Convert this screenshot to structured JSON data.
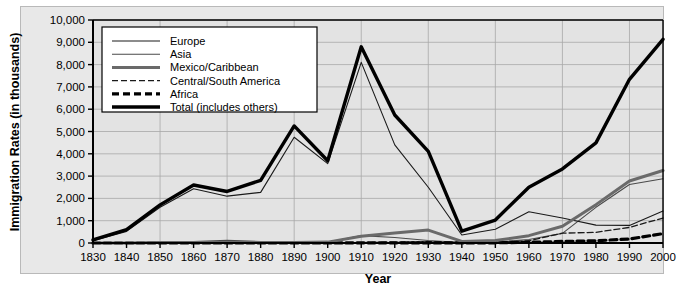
{
  "chart_data": {
    "type": "line",
    "title": "",
    "xlabel": "Year",
    "ylabel": "Immigration Rates (in thousands)",
    "xlim": [
      1830,
      2000
    ],
    "ylim": [
      0,
      10000
    ],
    "grid": true,
    "legend_position": "top-left",
    "x_tick_labels": [
      "1830",
      "1840",
      "1850",
      "1860",
      "1870",
      "1880",
      "1890",
      "1900",
      "1910",
      "1920",
      "1930",
      "1940",
      "1950",
      "1960",
      "1970",
      "1980",
      "1990",
      "2000"
    ],
    "y_tick_labels": [
      "0",
      "1,000",
      "2,000",
      "3,000",
      "4,000",
      "5,000",
      "6,000",
      "7,000",
      "8,000",
      "9,000",
      "10,000"
    ],
    "x": [
      1830,
      1840,
      1850,
      1860,
      1870,
      1880,
      1890,
      1900,
      1910,
      1920,
      1930,
      1940,
      1950,
      1960,
      1970,
      1980,
      1990,
      2000
    ],
    "series": [
      {
        "name": "Europe",
        "style": "thin-solid",
        "color": "#1a1a1a",
        "values": [
          100,
          520,
          1600,
          2430,
          2100,
          2270,
          4740,
          3560,
          8100,
          4400,
          2500,
          360,
          620,
          1400,
          1120,
          800,
          790,
          1430
        ]
      },
      {
        "name": "Asia",
        "style": "thin-solid",
        "color": "#4a4a4a",
        "values": [
          0,
          0,
          40,
          60,
          120,
          70,
          70,
          30,
          330,
          250,
          110,
          20,
          40,
          160,
          430,
          1600,
          2620,
          2880
        ]
      },
      {
        "name": "Mexico/Caribbean",
        "style": "medium-solid",
        "color": "#6a6a6a",
        "values": [
          0,
          0,
          20,
          20,
          20,
          20,
          20,
          40,
          300,
          450,
          580,
          70,
          110,
          330,
          750,
          1720,
          2780,
          3250
        ]
      },
      {
        "name": "Central/South America",
        "style": "thin-dashed",
        "color": "#1a1a1a",
        "values": [
          0,
          0,
          0,
          0,
          0,
          0,
          0,
          0,
          20,
          40,
          60,
          20,
          30,
          100,
          440,
          480,
          700,
          1120
        ]
      },
      {
        "name": "Africa",
        "style": "thick-dashed",
        "color": "#000000",
        "values": [
          0,
          0,
          0,
          0,
          0,
          0,
          0,
          0,
          10,
          10,
          10,
          5,
          10,
          30,
          70,
          100,
          180,
          420
        ]
      },
      {
        "name": "Total (includes others)",
        "style": "thick-solid",
        "color": "#000000",
        "values": [
          140,
          600,
          1710,
          2600,
          2310,
          2810,
          5250,
          3690,
          8800,
          5740,
          4110,
          530,
          1030,
          2500,
          3320,
          4490,
          7340,
          9130
        ]
      }
    ]
  },
  "legend": {
    "items": [
      {
        "label": "Europe"
      },
      {
        "label": "Asia"
      },
      {
        "label": "Mexico/Caribbean"
      },
      {
        "label": "Central/South America"
      },
      {
        "label": "Africa"
      },
      {
        "label": "Total (includes others)"
      }
    ]
  }
}
